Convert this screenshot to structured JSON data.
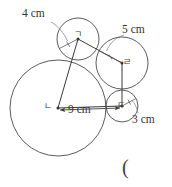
{
  "figure": {
    "type": "geometry-diagram",
    "stroke_color": "#444444",
    "background_color": "#ffffff",
    "labels": {
      "dim_top_left": "4 cm",
      "dim_top_right": "5 cm",
      "dim_bottom_right": "3 cm",
      "dim_bottom_base": "9 cm",
      "vertex_a": "ㄱ",
      "vertex_b": "ㄴ",
      "vertex_c": "ㄷ",
      "vertex_d": "ㄹ",
      "trailing_paren": "("
    },
    "circles": [
      {
        "name": "circle-a",
        "center_label": "ㄱ",
        "cx": 78,
        "cy": 39,
        "r": 21,
        "radius_label": "4 cm"
      },
      {
        "name": "circle-b",
        "center_label": "ㄴ",
        "cx": 58,
        "cy": 108,
        "r": 48,
        "radius_label": "9 cm"
      },
      {
        "name": "circle-c",
        "center_label": "ㄷ",
        "cx": 122,
        "cy": 106,
        "r": 16,
        "radius_label": "3 cm"
      },
      {
        "name": "circle-d",
        "center_label": "ㄹ",
        "cx": 122,
        "cy": 63,
        "r": 26,
        "radius_label": "5 cm"
      }
    ],
    "quadrilateral": {
      "name": "center-quadrilateral",
      "vertices": [
        "ㄱ",
        "ㄹ",
        "ㄷ",
        "ㄴ"
      ],
      "points": [
        [
          78,
          39
        ],
        [
          122,
          63
        ],
        [
          122,
          106
        ],
        [
          58,
          108
        ]
      ]
    },
    "radii_drawn": [
      {
        "from": "ㄱ",
        "to_angle_deg": 207,
        "label": "4 cm"
      },
      {
        "from": "ㄹ",
        "to_angle_deg": 152,
        "label": "5 cm"
      },
      {
        "from": "ㄷ",
        "to_angle_deg": 28,
        "label": "3 cm"
      },
      {
        "from": "ㄴ",
        "to_angle_deg": 0,
        "label": "9 cm"
      }
    ]
  }
}
